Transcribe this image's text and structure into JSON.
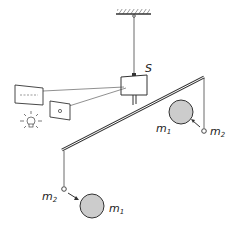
{
  "diagram": {
    "labels": {
      "mirror": "S",
      "large_mass_right": "m",
      "large_mass_right_sub": "1",
      "small_mass_right": "m",
      "small_mass_right_sub": "2",
      "small_mass_left": "m",
      "small_mass_left_sub": "2",
      "large_mass_left": "m",
      "large_mass_left_sub": "1"
    },
    "colors": {
      "line": "#333333",
      "mass_fill": "#cccccc"
    }
  }
}
